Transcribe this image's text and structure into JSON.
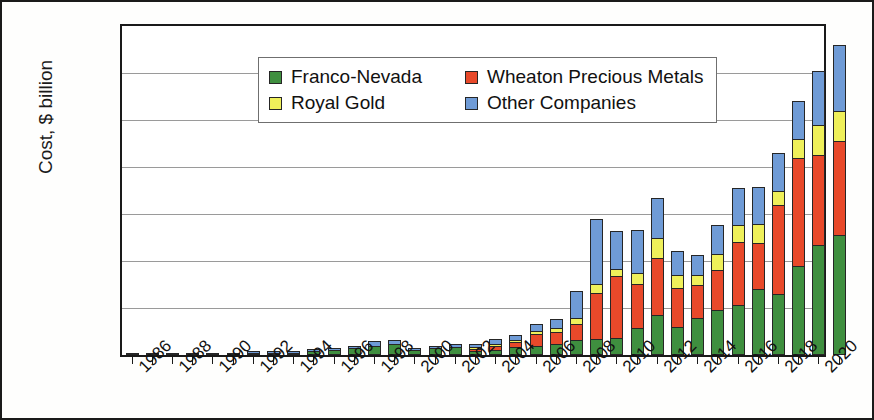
{
  "chart_data": {
    "type": "bar",
    "title": "",
    "subtitle": "",
    "stacked": true,
    "xlabel": "",
    "ylabel": "Cost, $ billion",
    "ylim": [
      0,
      70
    ],
    "ytick_labels": [
      "0",
      "10",
      "20",
      "30",
      "40",
      "50",
      "60",
      "70"
    ],
    "ytick_values": [
      0,
      10,
      20,
      30,
      40,
      50,
      60,
      70
    ],
    "grid": "horizontal",
    "legend_position": "top-left-inside",
    "categories": [
      "1986",
      "1987",
      "1988",
      "1989",
      "1990",
      "1991",
      "1992",
      "1993",
      "1994",
      "1995",
      "1996",
      "1997",
      "1998",
      "1999",
      "2000",
      "2001",
      "2002",
      "2003",
      "2004",
      "2005",
      "2006",
      "2007",
      "2008",
      "2009",
      "2010",
      "2011",
      "2012",
      "2013",
      "2014",
      "2015",
      "2016",
      "2017",
      "2018",
      "2019",
      "2020",
      "2021"
    ],
    "xtick_labels": [
      "1986",
      "1988",
      "1990",
      "1992",
      "1994",
      "1996",
      "1998",
      "2000",
      "2002",
      "2004",
      "2006",
      "2008",
      "2010",
      "2012",
      "2014",
      "2016",
      "2018",
      "2020"
    ],
    "series": [
      {
        "name": "Franco-Nevada",
        "color": "#3f8f3f",
        "values": [
          0.05,
          0.05,
          0.1,
          0.1,
          0.15,
          0.2,
          0.4,
          0.45,
          0.5,
          0.8,
          1.1,
          1.4,
          2.0,
          2.3,
          1.0,
          1.5,
          1.8,
          0.9,
          1.1,
          1.6,
          2.0,
          2.4,
          3.3,
          3.4,
          3.7,
          5.8,
          8.5,
          5.9,
          7.8,
          9.6,
          10.6,
          14.0,
          12.9,
          19.0,
          23.5,
          25.5
        ]
      },
      {
        "name": "Wheaton Precious Metals",
        "color": "#e8492a",
        "values": [
          0,
          0,
          0,
          0,
          0,
          0,
          0,
          0,
          0,
          0,
          0,
          0,
          0,
          0,
          0,
          0,
          0,
          0.3,
          0.9,
          1.2,
          2.4,
          2.5,
          3.3,
          9.8,
          13.2,
          9.4,
          12.2,
          8.3,
          7.1,
          8.4,
          13.5,
          9.9,
          19.0,
          23.0,
          19.0,
          20.0
        ]
      },
      {
        "name": "Royal Gold",
        "color": "#eff05a",
        "values": [
          0,
          0,
          0,
          0,
          0,
          0,
          0,
          0,
          0,
          0,
          0,
          0,
          0,
          0,
          0,
          0,
          0,
          0.2,
          0.3,
          0.5,
          0.8,
          0.9,
          1.2,
          1.9,
          1.4,
          2.3,
          4.1,
          2.8,
          2.1,
          3.4,
          3.5,
          4.0,
          3.0,
          4.0,
          6.5,
          6.5
        ]
      },
      {
        "name": "Other Companies",
        "color": "#6f9bd6",
        "values": [
          0,
          0,
          0,
          0,
          0,
          0,
          0.1,
          0.1,
          0.2,
          0.3,
          0.5,
          0.6,
          1.0,
          0.9,
          0.5,
          0.5,
          0.5,
          0.6,
          0.9,
          1.0,
          1.3,
          1.9,
          5.8,
          13.9,
          8.1,
          9.1,
          8.6,
          5.2,
          4.2,
          6.3,
          8.0,
          7.9,
          8.1,
          8.0,
          11.5,
          14.0
        ]
      }
    ],
    "totals": [
      0.05,
      0.05,
      0.1,
      0.1,
      0.15,
      0.2,
      0.5,
      0.55,
      0.7,
      1.1,
      1.6,
      2.0,
      3.0,
      3.2,
      1.5,
      2.0,
      2.3,
      2.0,
      3.2,
      4.3,
      6.5,
      7.7,
      13.6,
      28.9,
      26.4,
      26.6,
      33.4,
      22.2,
      21.2,
      27.7,
      35.6,
      35.8,
      43.0,
      54.0,
      60.5,
      66.0
    ]
  },
  "legend": {
    "items": [
      {
        "label": "Franco-Nevada"
      },
      {
        "label": "Wheaton Precious Metals"
      },
      {
        "label": "Royal Gold"
      },
      {
        "label": "Other Companies"
      }
    ]
  }
}
